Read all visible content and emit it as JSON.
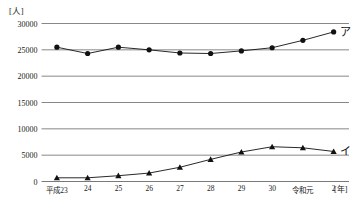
{
  "chart_data": {
    "type": "line",
    "title": "",
    "xlabel": "[年]",
    "ylabel": "[人]",
    "ylim": [
      0,
      30000
    ],
    "ytick_values": [
      0,
      5000,
      10000,
      15000,
      20000,
      25000,
      30000
    ],
    "ytick_labels": [
      "0",
      "5000",
      "10000",
      "15000",
      "20000",
      "25000",
      "30000"
    ],
    "categories": [
      "平成23",
      "24",
      "25",
      "26",
      "27",
      "28",
      "29",
      "30",
      "令和元",
      "2"
    ],
    "grid": true,
    "legend_position": "inline-right",
    "series": [
      {
        "name": "ア",
        "marker": "circle",
        "values": [
          25500,
          24300,
          25500,
          25000,
          24400,
          24300,
          24800,
          25400,
          26800,
          28400
        ]
      },
      {
        "name": "イ",
        "marker": "triangle",
        "values": [
          700,
          700,
          1100,
          1600,
          2700,
          4200,
          5600,
          6600,
          6400,
          5700
        ]
      }
    ],
    "annotations": [
      {
        "text": "ア",
        "series": 0,
        "at_category": "2"
      },
      {
        "text": "イ",
        "series": 1,
        "at_category": "2"
      }
    ]
  },
  "axis": {
    "y_unit": "[人]",
    "x_unit": "[年]"
  },
  "footer": {
    "caption": ""
  },
  "colors": {
    "line": "#111111",
    "grid": "#7a7a7a",
    "axis": "#555555",
    "text": "#1a1a1a"
  }
}
